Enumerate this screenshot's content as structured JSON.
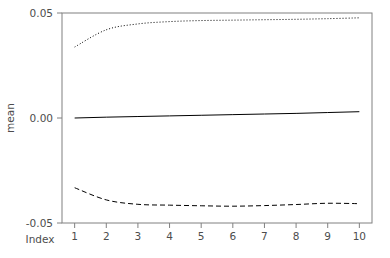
{
  "chart_data": {
    "type": "line",
    "title": "",
    "subtitle": "",
    "xlabel": "Index",
    "ylabel": "mean",
    "x": [
      1,
      2,
      3,
      4,
      5,
      6,
      7,
      8,
      9,
      10
    ],
    "xlim": [
      0.6,
      10.4
    ],
    "ylim": [
      -0.05,
      0.05
    ],
    "xticks": [
      "1",
      "2",
      "3",
      "4",
      "5",
      "6",
      "7",
      "8",
      "9",
      "10"
    ],
    "xtick_values": [
      1,
      2,
      3,
      4,
      5,
      6,
      7,
      8,
      9,
      10
    ],
    "yticks": [
      "0.05",
      "0.00",
      "-0.05"
    ],
    "ytick_values": [
      0.05,
      0.0,
      -0.05
    ],
    "grid": false,
    "legend": "none",
    "box": "full",
    "series": [
      {
        "name": "upper bound",
        "style": "dotted",
        "color": "#000000",
        "values": [
          0.0338,
          0.042,
          0.0448,
          0.0459,
          0.0464,
          0.0466,
          0.0468,
          0.047,
          0.0473,
          0.0477
        ]
      },
      {
        "name": "mean",
        "style": "solid",
        "color": "#000000",
        "values": [
          0.0,
          0.0004,
          0.0007,
          0.001,
          0.0013,
          0.0016,
          0.0019,
          0.0022,
          0.0026,
          0.003
        ]
      },
      {
        "name": "lower bound",
        "style": "dashed",
        "color": "#000000",
        "values": [
          -0.0332,
          -0.039,
          -0.0411,
          -0.0415,
          -0.0418,
          -0.042,
          -0.0417,
          -0.0412,
          -0.0406,
          -0.0408
        ]
      }
    ]
  },
  "axes": {
    "x_label": "Index",
    "y_label": "mean"
  },
  "colors": {
    "background": "#ffffff",
    "axis": "#808080",
    "text": "#4d4d4d",
    "line": "#000000"
  }
}
